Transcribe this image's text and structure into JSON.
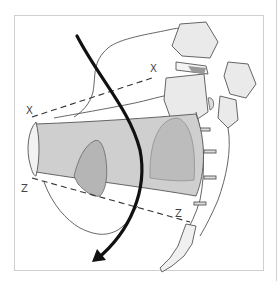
{
  "figure": {
    "labels": {
      "x_left": "X",
      "x_right": "X",
      "z_left": "Z",
      "z_right": "Z"
    },
    "colors": {
      "frame": "#cfcfcf",
      "outline": "#555555",
      "shade_light": "#cfcfcf",
      "shade_dark": "#b5b5b5",
      "arrow": "#111111",
      "bone_fill": "#e6e6e6"
    }
  }
}
